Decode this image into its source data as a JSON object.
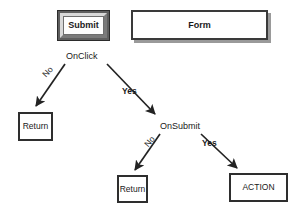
{
  "diagram": {
    "nodes": {
      "submit_button": {
        "label": "Submit",
        "type": "3d-button"
      },
      "form_box": {
        "label": "Form",
        "type": "shadowed-box"
      },
      "decision_onclick": {
        "label": "OnClick",
        "type": "decision-text"
      },
      "decision_onsubmit": {
        "label": "OnSubmit",
        "type": "decision-text"
      },
      "return_1": {
        "label": "Return",
        "type": "box"
      },
      "return_2": {
        "label": "Return",
        "type": "box"
      },
      "action": {
        "label": "ACTION",
        "type": "box"
      }
    },
    "edge_labels": {
      "onclick_no": "No",
      "onclick_yes": "Yes",
      "onsubmit_no": "No",
      "onsubmit_yes": "Yes"
    },
    "colors": {
      "stroke": "#2e2e2e",
      "background": "#ffffff",
      "button_frame": "#5e5e5e",
      "shadow": "#9a9a9a",
      "text": "#1a1a1a"
    }
  }
}
